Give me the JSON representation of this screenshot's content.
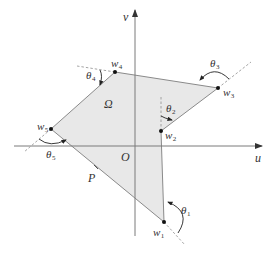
{
  "figure": {
    "axes": {
      "horizontal_label": "u",
      "vertical_label": "v",
      "origin_label": "O"
    },
    "region_label": "Ω",
    "point_label": "P",
    "vertices": [
      {
        "name": "w",
        "sub": "1"
      },
      {
        "name": "w",
        "sub": "2"
      },
      {
        "name": "w",
        "sub": "3"
      },
      {
        "name": "w",
        "sub": "4"
      },
      {
        "name": "w",
        "sub": "5"
      }
    ],
    "angles": [
      {
        "name": "θ",
        "sub": "1"
      },
      {
        "name": "θ",
        "sub": "2"
      },
      {
        "name": "θ",
        "sub": "3"
      },
      {
        "name": "θ",
        "sub": "4"
      },
      {
        "name": "θ",
        "sub": "5"
      }
    ],
    "colors": {
      "fill": "#e6e6e6",
      "edge": "#8a8a8a",
      "axis": "#7a7a7a",
      "dashed": "#9a9a9a",
      "vertex": "#111111",
      "text": "#333333"
    }
  }
}
